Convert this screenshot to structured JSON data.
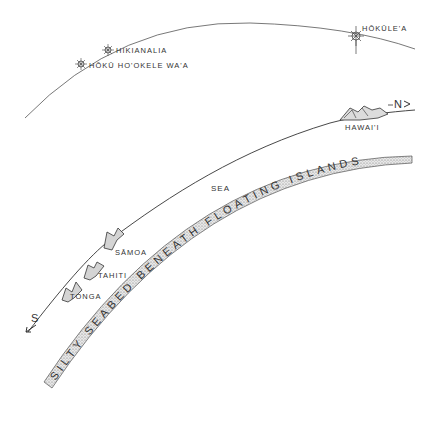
{
  "sky": {
    "stars": [
      {
        "name": "Hōkūle'a",
        "label": "HŌKŪLE'A"
      },
      {
        "name": "Hikianalia",
        "label": "HIKIANALIA"
      },
      {
        "name": "Hōkū Ho'okele Wa'a",
        "label": "HŌKŪ HO'OKELE WA'A"
      }
    ]
  },
  "surface": {
    "sea_label": "SEA",
    "islands": [
      {
        "name": "Hawai'i",
        "label": "HAWAI'I"
      },
      {
        "name": "Sāmoa",
        "label": "SĀMOA"
      },
      {
        "name": "Tahiti",
        "label": "TAHITI"
      },
      {
        "name": "Tonga",
        "label": "TONGA"
      }
    ],
    "directions": {
      "north": "N",
      "south": "S"
    }
  },
  "seabed": {
    "label": "SILTY SEABED BENEATH FLOATING ISLANDS"
  },
  "colors": {
    "ink": "#333333",
    "background": "#ffffff",
    "stipple": "#9a9a9a"
  }
}
